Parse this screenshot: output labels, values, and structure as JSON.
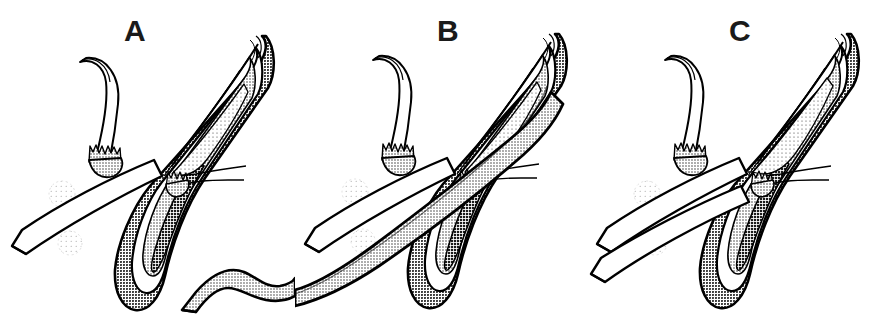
{
  "figure": {
    "kind": "anatomical-line-drawing",
    "background_color": "#ffffff",
    "width": 884,
    "height": 334,
    "panel_count": 3,
    "style": "black ink line art with halftone stipple gray shading"
  },
  "palette": {
    "ink": "#000000",
    "label_color": "#1a1a1a",
    "paper": "#ffffff",
    "gray_mid": "#b0b0b0",
    "gray_light": "#d8d8d8",
    "gray_pale": "#ececec",
    "gray_dark": "#6e6e6e",
    "gray_ghost": "#f0f0f0"
  },
  "panels": [
    {
      "id": "panel-a",
      "label": "A",
      "label_x": 124,
      "parts": {
        "upper_hook": "curved hook with serrated base, upper left",
        "right_hook": "small serrated hook, mid right",
        "body_outline": "elongated tapering body, apex upper right",
        "dark_blade": "dark gray tapering blade, lower center",
        "white_instrument": "single white instrument shaft crossing lower left",
        "ghost_markers": "two faint dotted circles",
        "free_tube": "detached gray S-curved tube at lower right"
      }
    },
    {
      "id": "panel-b",
      "label": "B",
      "label_x": 142,
      "parts": {
        "upper_hook": "curved hook with serrated base, upper left",
        "right_hook": "small serrated hook, mid right",
        "body_outline": "elongated tapering body, apex upper right",
        "dark_blade": "dark gray tapering blade, lower center",
        "white_instrument": "single white instrument shaft crossing lower left",
        "ghost_markers": "two faint dotted circles",
        "inserted_tube": "gray tube threaded through the body and exiting lower left"
      }
    },
    {
      "id": "panel-c",
      "label": "C",
      "label_x": 140,
      "parts": {
        "upper_hook": "curved hook with serrated base, upper left",
        "right_hook": "small serrated hook, mid right",
        "body_outline": "elongated tapering body, apex upper right",
        "dark_blade": "dark gray tapering blade, lower center",
        "white_instrument_upper": "white instrument shaft crossing lower left",
        "white_instrument_lower": "second white instrument shaft below the first",
        "ghost_markers": "two faint dotted circles"
      }
    }
  ]
}
